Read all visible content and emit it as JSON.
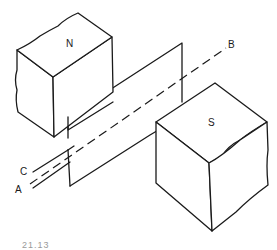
{
  "figure": {
    "labels": {
      "north_pole": "N",
      "south_pole": "S",
      "axis_end_b": "B",
      "axis_end_a": "A",
      "wire_end_c": "C"
    },
    "caption": "21.13"
  }
}
